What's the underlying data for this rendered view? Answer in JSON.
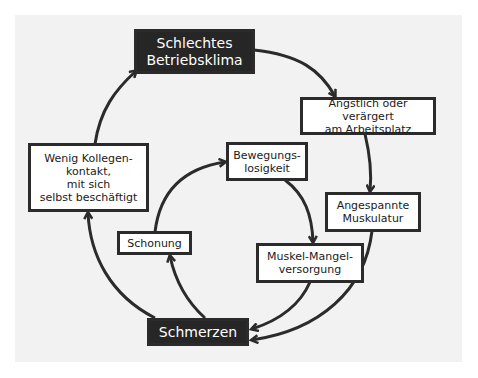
{
  "diagram": {
    "colors": {
      "dark_box": "#262626",
      "light_box": "#ffffff",
      "border": "#2b2b2b",
      "arrow": "#2b2b2b",
      "panel": "#f2f2f2"
    },
    "nodes": [
      {
        "id": "betriebsklima",
        "label": "Schlechtes\nBetriebsklima",
        "style": "dark"
      },
      {
        "id": "aengstlich",
        "label": "Ängstlich oder verärgert\nam Arbeitsplatz",
        "style": "light"
      },
      {
        "id": "muskulatur",
        "label": "Angespannte\nMuskulatur",
        "style": "light"
      },
      {
        "id": "versorgung",
        "label": "Muskel-Mangel-\nversorgung",
        "style": "light"
      },
      {
        "id": "schmerzen",
        "label": "Schmerzen",
        "style": "dark"
      },
      {
        "id": "kollegen",
        "label": "Wenig Kollegen-\nkontakt,\nmit sich\nselbst beschäftigt",
        "style": "light"
      },
      {
        "id": "schonung",
        "label": "Schonung",
        "style": "light"
      },
      {
        "id": "bewegung",
        "label": "Bewegungs-\nlosigkeit",
        "style": "light"
      }
    ],
    "edges": [
      {
        "from": "betriebsklima",
        "to": "aengstlich"
      },
      {
        "from": "aengstlich",
        "to": "muskulatur"
      },
      {
        "from": "muskulatur",
        "to": "schmerzen"
      },
      {
        "from": "versorgung",
        "to": "schmerzen"
      },
      {
        "from": "schmerzen",
        "to": "kollegen"
      },
      {
        "from": "kollegen",
        "to": "betriebsklima"
      },
      {
        "from": "schmerzen",
        "to": "schonung"
      },
      {
        "from": "schonung",
        "to": "bewegung"
      },
      {
        "from": "bewegung",
        "to": "versorgung"
      }
    ]
  }
}
